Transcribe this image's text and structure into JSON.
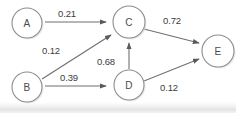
{
  "diagram": {
    "type": "node-link-diagram",
    "canvas": {
      "width": 236,
      "height": 113
    },
    "style": {
      "background_color": "#ffffff",
      "node_stroke_color": "#8d8d8d",
      "node_fill_color": "#ffffff",
      "edge_color": "#6f6f6f",
      "label_color": "#3d3d3d"
    },
    "nodes": [
      {
        "id": "A",
        "label": "A",
        "cx": 27,
        "cy": 23,
        "r": 15
      },
      {
        "id": "B",
        "label": "B",
        "cx": 27,
        "cy": 87,
        "r": 15
      },
      {
        "id": "C",
        "label": "C",
        "cx": 129,
        "cy": 22,
        "r": 16
      },
      {
        "id": "D",
        "label": "D",
        "cx": 129,
        "cy": 85,
        "r": 15
      },
      {
        "id": "E",
        "label": "E",
        "cx": 218,
        "cy": 51,
        "r": 16
      }
    ],
    "edges": [
      {
        "id": "A-C",
        "from": "A",
        "to": "C",
        "weight": "0.21",
        "label_x": 67,
        "label_y": 13
      },
      {
        "id": "B-C",
        "from": "B",
        "to": "C",
        "weight": "0.12",
        "label_x": 51,
        "label_y": 50
      },
      {
        "id": "B-D",
        "from": "B",
        "to": "D",
        "weight": "0.39",
        "label_x": 69,
        "label_y": 77
      },
      {
        "id": "D-C",
        "from": "D",
        "to": "C",
        "weight": "0.68",
        "label_x": 106,
        "label_y": 61
      },
      {
        "id": "C-E",
        "from": "C",
        "to": "E",
        "weight": "0.72",
        "label_x": 172,
        "label_y": 20
      },
      {
        "id": "D-E",
        "from": "D",
        "to": "E",
        "weight": "0.12",
        "label_x": 169,
        "label_y": 87
      }
    ]
  }
}
